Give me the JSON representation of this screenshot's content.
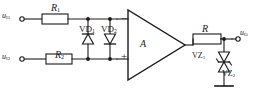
{
  "diagram": {
    "type": "electronic-schematic",
    "background_color": "#ffffff",
    "line_color": "#1a1a1a"
  },
  "labels": {
    "input_1": "u",
    "input_1_sub": "I1",
    "input_2": "u",
    "input_2_sub": "I2",
    "output": "u",
    "output_sub": "O",
    "resistor_1": "R",
    "resistor_1_sub": "1",
    "resistor_2": "R",
    "resistor_2_sub": "2",
    "feedback_resistor": "R",
    "diode_1": "VD",
    "diode_1_sub": "1",
    "diode_2": "VD",
    "diode_2_sub": "2",
    "zener_1": "VZ",
    "zener_1_sub": "1",
    "zener_2": "VZ",
    "zener_2_sub": "2",
    "opamp": "A",
    "inverting_terminal": "−",
    "noninverting_terminal": "+"
  },
  "components": [
    {
      "name": "resistor-r1",
      "kind": "resistor",
      "label": "R1"
    },
    {
      "name": "resistor-r2",
      "kind": "resistor",
      "label": "R2"
    },
    {
      "name": "resistor-feedback",
      "kind": "resistor",
      "label": "R"
    },
    {
      "name": "diode-vd1",
      "kind": "diode",
      "label": "VD1",
      "orientation": "up"
    },
    {
      "name": "diode-vd2",
      "kind": "diode",
      "label": "VD2",
      "orientation": "down"
    },
    {
      "name": "zener-vz1",
      "kind": "zener-diode",
      "label": "VZ1",
      "orientation": "down"
    },
    {
      "name": "zener-vz2",
      "kind": "zener-diode",
      "label": "VZ2",
      "orientation": "up"
    },
    {
      "name": "opamp",
      "kind": "op-amp",
      "label": "A"
    },
    {
      "name": "terminal-input-1",
      "kind": "terminal",
      "label": "uI1"
    },
    {
      "name": "terminal-input-2",
      "kind": "terminal",
      "label": "uI2"
    },
    {
      "name": "terminal-output",
      "kind": "terminal",
      "label": "uO"
    },
    {
      "name": "ground-symbol",
      "kind": "ground",
      "label": ""
    }
  ]
}
